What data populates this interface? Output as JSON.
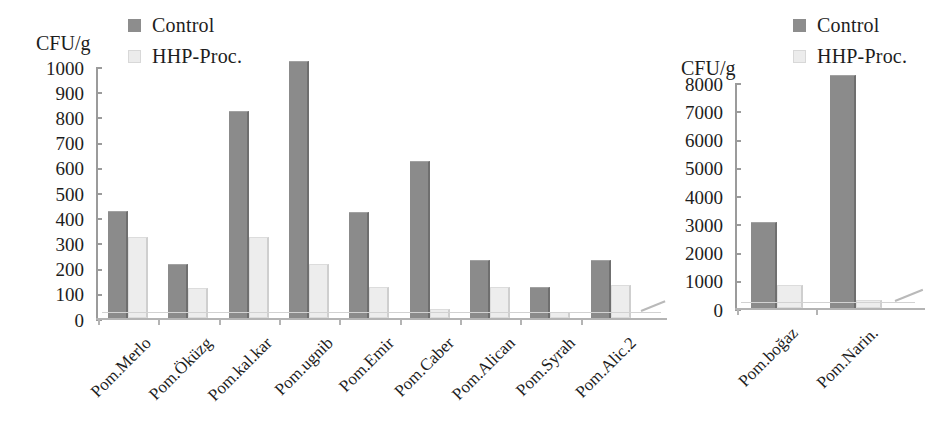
{
  "chart_data": [
    {
      "id": "left",
      "type": "bar",
      "title": "",
      "xlabel": "",
      "ylabel": "CFU/g",
      "ylim": [
        0,
        1000
      ],
      "ytick_step": 100,
      "yticks": [
        1000,
        900,
        800,
        700,
        600,
        500,
        400,
        300,
        200,
        100,
        0
      ],
      "grid": false,
      "legend_position": "top-left",
      "categories": [
        "Pom.Merlo",
        "Pom.Öküzg",
        "Pom.kal.kar",
        "Pom.ugnib",
        "Pom.Emir",
        "Pom.Caber",
        "Pom.Alican",
        "Pom.Syrah",
        "Pom.Alic.2"
      ],
      "series": [
        {
          "name": "Control",
          "color": "#8b8b8b",
          "values": [
            425,
            215,
            822,
            1020,
            420,
            625,
            230,
            125,
            230
          ]
        },
        {
          "name": "HHP-Proc.",
          "color": "#ededed",
          "values": [
            320,
            120,
            320,
            215,
            125,
            35,
            125,
            25,
            130
          ]
        }
      ]
    },
    {
      "id": "right",
      "type": "bar",
      "title": "",
      "xlabel": "",
      "ylabel": "CFU/g",
      "ylim": [
        0,
        8000
      ],
      "ytick_step": 1000,
      "yticks": [
        8000,
        7000,
        6000,
        5000,
        4000,
        3000,
        2000,
        1000,
        0
      ],
      "grid": false,
      "legend_position": "top-left",
      "categories": [
        "Pom.boğaz",
        "Pom.Narin."
      ],
      "series": [
        {
          "name": "Control",
          "color": "#8b8b8b",
          "values": [
            3050,
            8250
          ]
        },
        {
          "name": "HHP-Proc.",
          "color": "#ededed",
          "values": [
            800,
            300
          ]
        }
      ]
    }
  ],
  "left_chart": {
    "axis_title": "CFU/g",
    "legend": [
      {
        "label": "Control",
        "swatch": "control-swatch"
      },
      {
        "label": "HHP-Proc.",
        "swatch": "hhp-swatch"
      }
    ],
    "ytick_labels": [
      "1000",
      "900",
      "800",
      "700",
      "600",
      "500",
      "400",
      "300",
      "200",
      "100",
      "0"
    ],
    "xtick_labels": [
      "Pom.Merlo",
      "Pom.Öküzg",
      "Pom.kal.kar",
      "Pom.ugnib",
      "Pom.Emir",
      "Pom.Caber",
      "Pom.Alican",
      "Pom.Syrah",
      "Pom.Alic.2"
    ]
  },
  "right_chart": {
    "axis_title": "CFU/g",
    "legend": [
      {
        "label": "Control",
        "swatch": "control-swatch"
      },
      {
        "label": "HHP-Proc.",
        "swatch": "hhp-swatch"
      }
    ],
    "ytick_labels": [
      "8000",
      "7000",
      "6000",
      "5000",
      "4000",
      "3000",
      "2000",
      "1000",
      "0"
    ],
    "xtick_labels": [
      "Pom.boğaz",
      "Pom.Narin."
    ]
  },
  "colors": {
    "control": "#8b8b8b",
    "hhp": "#ededed",
    "axis": "#9b9b9b",
    "text": "#1d1d1d",
    "background": "#ffffff"
  }
}
